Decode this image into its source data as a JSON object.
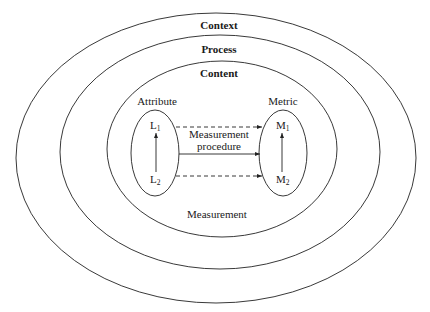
{
  "diagram": {
    "layers": [
      {
        "id": "context",
        "label": "Context"
      },
      {
        "id": "process",
        "label": "Process"
      },
      {
        "id": "content",
        "label": "Content"
      }
    ],
    "attribute": {
      "label": "Attribute",
      "top": {
        "main": "L",
        "sub": "1"
      },
      "bottom": {
        "main": "L",
        "sub": "2"
      }
    },
    "metric": {
      "label": "Metric",
      "top": {
        "main": "M",
        "sub": "1"
      },
      "bottom": {
        "main": "M",
        "sub": "2"
      }
    },
    "procedure": {
      "line1": "Measurement",
      "line2": "procedure"
    },
    "measurement_label": "Measurement",
    "colors": {
      "stroke": "#222222",
      "text": "#1a1a1a",
      "background": "#ffffff"
    }
  }
}
